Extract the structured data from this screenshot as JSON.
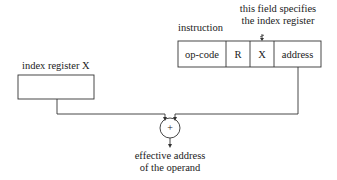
{
  "labels": {
    "instruction": "instruction",
    "note_line1": "this field specifies",
    "note_line2": "the index register",
    "index_register": "index register X",
    "output_line1": "effective address",
    "output_line2": "of the operand",
    "adder_symbol": "+"
  },
  "instruction_fields": [
    "op-code",
    "R",
    "X",
    "address"
  ]
}
